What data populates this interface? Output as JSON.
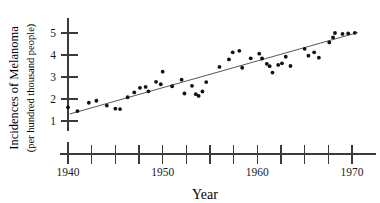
{
  "chart_data": {
    "type": "scatter",
    "title": "",
    "xlabel": "Year",
    "ylabel": "Incidences of Melanoma",
    "ylabel_sub": "(per hundred thousand people)",
    "xlim": [
      1940,
      1971.5
    ],
    "ylim": [
      0.6,
      5.6
    ],
    "grid": false,
    "legend": null,
    "xticks": [
      1940,
      1942.5,
      1945,
      1947.5,
      1950,
      1952.5,
      1955,
      1957.5,
      1960,
      1962.5,
      1965,
      1967.5,
      1970
    ],
    "xtick_labels": [
      "1940",
      "",
      "",
      "",
      "1950",
      "",
      "",
      "",
      "1960",
      "",
      "",
      "",
      "1970"
    ],
    "yticks": [
      1,
      2,
      3,
      4,
      5
    ],
    "ytick_labels": [
      "1",
      "2",
      "3",
      "4",
      "5"
    ],
    "point_color": "#111111",
    "line_color": "#444444",
    "axis_color": "#3a3a3a",
    "trendline": {
      "x": [
        1940.2,
        1970.6
      ],
      "y": [
        1.32,
        5.02
      ]
    },
    "points": [
      {
        "x": 1940.0,
        "y": 1.62
      },
      {
        "x": 1941.0,
        "y": 1.45
      },
      {
        "x": 1942.2,
        "y": 1.83
      },
      {
        "x": 1943.0,
        "y": 1.92
      },
      {
        "x": 1944.1,
        "y": 1.7
      },
      {
        "x": 1945.0,
        "y": 1.56
      },
      {
        "x": 1945.5,
        "y": 1.54
      },
      {
        "x": 1946.3,
        "y": 2.08
      },
      {
        "x": 1947.0,
        "y": 2.3
      },
      {
        "x": 1947.6,
        "y": 2.51
      },
      {
        "x": 1948.2,
        "y": 2.55
      },
      {
        "x": 1948.5,
        "y": 2.35
      },
      {
        "x": 1949.3,
        "y": 2.78
      },
      {
        "x": 1949.8,
        "y": 2.67
      },
      {
        "x": 1950.0,
        "y": 3.24
      },
      {
        "x": 1951.0,
        "y": 2.58
      },
      {
        "x": 1952.0,
        "y": 2.88
      },
      {
        "x": 1952.3,
        "y": 2.25
      },
      {
        "x": 1953.1,
        "y": 2.6
      },
      {
        "x": 1953.5,
        "y": 2.22
      },
      {
        "x": 1953.8,
        "y": 2.14
      },
      {
        "x": 1954.2,
        "y": 2.34
      },
      {
        "x": 1954.6,
        "y": 2.77
      },
      {
        "x": 1956.0,
        "y": 3.46
      },
      {
        "x": 1957.0,
        "y": 3.8
      },
      {
        "x": 1957.4,
        "y": 4.12
      },
      {
        "x": 1958.1,
        "y": 4.19
      },
      {
        "x": 1958.4,
        "y": 3.42
      },
      {
        "x": 1959.3,
        "y": 3.85
      },
      {
        "x": 1960.2,
        "y": 4.06
      },
      {
        "x": 1960.5,
        "y": 3.84
      },
      {
        "x": 1961.0,
        "y": 3.6
      },
      {
        "x": 1961.3,
        "y": 3.49
      },
      {
        "x": 1961.6,
        "y": 3.2
      },
      {
        "x": 1962.2,
        "y": 3.55
      },
      {
        "x": 1962.6,
        "y": 3.62
      },
      {
        "x": 1963.0,
        "y": 3.92
      },
      {
        "x": 1963.5,
        "y": 3.5
      },
      {
        "x": 1965.0,
        "y": 4.28
      },
      {
        "x": 1965.4,
        "y": 3.97
      },
      {
        "x": 1966.0,
        "y": 4.12
      },
      {
        "x": 1966.5,
        "y": 3.88
      },
      {
        "x": 1967.6,
        "y": 4.57
      },
      {
        "x": 1968.0,
        "y": 4.8
      },
      {
        "x": 1968.2,
        "y": 5.0
      },
      {
        "x": 1969.0,
        "y": 4.96
      },
      {
        "x": 1969.6,
        "y": 4.98
      },
      {
        "x": 1970.3,
        "y": 5.01
      }
    ]
  }
}
